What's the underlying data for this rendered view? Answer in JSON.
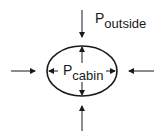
{
  "diagram": {
    "title": "",
    "labels": {
      "outside": {
        "main": "P",
        "sub": "outside"
      },
      "cabin": {
        "main": "P",
        "sub": "cabin"
      }
    },
    "colors": {
      "stroke": "#1a1a1a",
      "background": "#ffffff"
    },
    "elements": [
      {
        "type": "ellipse",
        "name": "cabin-hull",
        "cx": 82,
        "cy": 71,
        "rx": 35,
        "ry": 26
      },
      {
        "type": "arrow",
        "name": "outside-pressure-top",
        "direction": "down"
      },
      {
        "type": "arrow",
        "name": "outside-pressure-bottom",
        "direction": "up"
      },
      {
        "type": "arrow",
        "name": "outside-pressure-left",
        "direction": "right"
      },
      {
        "type": "arrow",
        "name": "outside-pressure-right",
        "direction": "left"
      },
      {
        "type": "arrow",
        "name": "cabin-pressure-up",
        "direction": "up"
      },
      {
        "type": "arrow",
        "name": "cabin-pressure-down",
        "direction": "down"
      },
      {
        "type": "arrow",
        "name": "cabin-pressure-left",
        "direction": "left"
      },
      {
        "type": "arrow",
        "name": "cabin-pressure-right",
        "direction": "right"
      }
    ]
  }
}
